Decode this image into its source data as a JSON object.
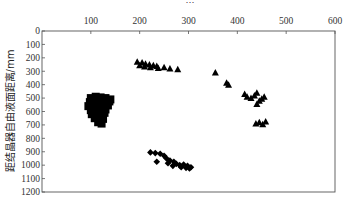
{
  "chart_data": {
    "type": "scatter",
    "title": "",
    "xlabel": "",
    "ylabel": "距结晶器自由液面距离/mm",
    "xlim": [
      0,
      600
    ],
    "ylim": [
      1200,
      0
    ],
    "x_axis_position": "top",
    "y_inverted": true,
    "grid": false,
    "x_ticks": [
      100,
      200,
      300,
      400,
      500,
      600
    ],
    "y_ticks": [
      0,
      100,
      200,
      300,
      400,
      500,
      600,
      700,
      800,
      900,
      1000,
      1100,
      1200
    ],
    "series": [
      {
        "name": "squares",
        "marker": "square",
        "points": [
          [
            100,
            500
          ],
          [
            110,
            490
          ],
          [
            120,
            495
          ],
          [
            130,
            500
          ],
          [
            140,
            510
          ],
          [
            98,
            530
          ],
          [
            108,
            520
          ],
          [
            118,
            525
          ],
          [
            128,
            530
          ],
          [
            138,
            525
          ],
          [
            95,
            560
          ],
          [
            105,
            555
          ],
          [
            115,
            550
          ],
          [
            125,
            560
          ],
          [
            135,
            555
          ],
          [
            100,
            590
          ],
          [
            110,
            585
          ],
          [
            120,
            590
          ],
          [
            130,
            585
          ],
          [
            102,
            620
          ],
          [
            112,
            615
          ],
          [
            122,
            620
          ],
          [
            128,
            610
          ],
          [
            108,
            650
          ],
          [
            118,
            645
          ],
          [
            125,
            655
          ],
          [
            115,
            680
          ],
          [
            122,
            690
          ]
        ]
      },
      {
        "name": "triangles",
        "marker": "triangle",
        "points": [
          [
            195,
            230
          ],
          [
            205,
            235
          ],
          [
            212,
            245
          ],
          [
            220,
            250
          ],
          [
            228,
            255
          ],
          [
            235,
            260
          ],
          [
            200,
            255
          ],
          [
            210,
            265
          ],
          [
            222,
            270
          ],
          [
            238,
            275
          ],
          [
            250,
            270
          ],
          [
            262,
            280
          ],
          [
            278,
            285
          ],
          [
            355,
            310
          ],
          [
            378,
            385
          ],
          [
            382,
            400
          ],
          [
            415,
            470
          ],
          [
            420,
            490
          ],
          [
            428,
            500
          ],
          [
            435,
            480
          ],
          [
            440,
            460
          ],
          [
            445,
            520
          ],
          [
            450,
            505
          ],
          [
            455,
            490
          ],
          [
            440,
            545
          ],
          [
            438,
            690
          ],
          [
            445,
            680
          ],
          [
            452,
            695
          ],
          [
            458,
            675
          ]
        ]
      },
      {
        "name": "diamonds",
        "marker": "diamond",
        "points": [
          [
            222,
            905
          ],
          [
            232,
            910
          ],
          [
            242,
            915
          ],
          [
            250,
            930
          ],
          [
            235,
            975
          ],
          [
            255,
            950
          ],
          [
            262,
            965
          ],
          [
            270,
            975
          ],
          [
            258,
            985
          ],
          [
            275,
            990
          ],
          [
            282,
            1000
          ],
          [
            290,
            995
          ],
          [
            298,
            1005
          ],
          [
            305,
            1015
          ],
          [
            268,
            1005
          ],
          [
            285,
            1015
          ],
          [
            295,
            1020
          ],
          [
            302,
            1025
          ]
        ]
      }
    ]
  },
  "title_partial": "…"
}
